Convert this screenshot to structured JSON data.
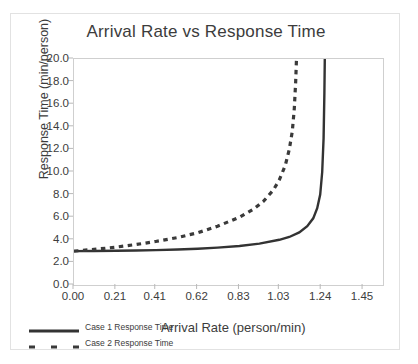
{
  "chart_data": {
    "type": "line",
    "title": "Arrival Rate vs Response Time",
    "xlabel": "Arrival Rate (person/min)",
    "ylabel": "Response Time (min/person)",
    "xlim": [
      0.0,
      1.55
    ],
    "ylim": [
      0.0,
      20.0
    ],
    "xticks": [
      "0.00",
      "0.21",
      "0.41",
      "0.62",
      "0.83",
      "1.03",
      "1.24",
      "1.45"
    ],
    "xtick_values": [
      0.0,
      0.21,
      0.41,
      0.62,
      0.83,
      1.03,
      1.24,
      1.45
    ],
    "yticks": [
      "0.0",
      "2.0",
      "4.0",
      "6.0",
      "8.0",
      "10.0",
      "12.0",
      "14.0",
      "16.0",
      "18.0",
      "20.0"
    ],
    "ytick_values": [
      0,
      2,
      4,
      6,
      8,
      10,
      12,
      14,
      16,
      18,
      20
    ],
    "grid": false,
    "legend_position": "bottom-left",
    "series": [
      {
        "name": "Case 1 Response Time",
        "style": "solid",
        "color": "#333333",
        "asymptote_x": 1.26,
        "x": [
          0.0,
          0.1,
          0.21,
          0.31,
          0.41,
          0.52,
          0.62,
          0.72,
          0.83,
          0.93,
          1.03,
          1.08,
          1.13,
          1.17,
          1.2,
          1.22,
          1.235,
          1.245,
          1.252,
          1.256,
          1.258
        ],
        "y": [
          3.0,
          3.01,
          3.03,
          3.05,
          3.09,
          3.14,
          3.21,
          3.31,
          3.45,
          3.66,
          4.0,
          4.25,
          4.65,
          5.2,
          5.9,
          6.8,
          8.0,
          10.0,
          13.0,
          17.0,
          20.0
        ]
      },
      {
        "name": "Case 2 Response Time",
        "style": "dashed",
        "color": "#3a3a3a",
        "asymptote_x": 1.12,
        "x": [
          0.0,
          0.1,
          0.21,
          0.31,
          0.41,
          0.52,
          0.62,
          0.72,
          0.83,
          0.9,
          0.95,
          1.0,
          1.03,
          1.06,
          1.08,
          1.095,
          1.105,
          1.112,
          1.116
        ],
        "y": [
          3.0,
          3.15,
          3.35,
          3.58,
          3.85,
          4.2,
          4.62,
          5.2,
          6.0,
          6.7,
          7.4,
          8.4,
          9.3,
          10.6,
          12.0,
          13.6,
          15.6,
          18.0,
          20.0
        ]
      }
    ]
  },
  "legend": {
    "items": [
      {
        "label": "Case 1 Response Time",
        "style": "solid"
      },
      {
        "label": "Case 2 Response Time",
        "style": "dashed"
      }
    ]
  }
}
